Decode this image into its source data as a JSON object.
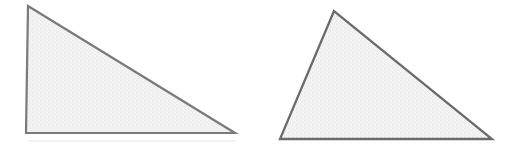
{
  "figure": {
    "title": "",
    "caption": "",
    "background_color": "#ffffff",
    "width": 522,
    "height": 152,
    "stroke_color": "#7a7a7a",
    "stroke_color_dark": "#6b6b6b",
    "fill_color": "#f1f1f1",
    "stroke_width": 2.2,
    "artifact_color": "#e8e8e8",
    "shapes": [
      {
        "name": "right-triangle",
        "kind": "triangle",
        "label": "",
        "vertices": [
          [
            28,
            6
          ],
          [
            26,
            133
          ],
          [
            235,
            133
          ]
        ],
        "points_attr": "28,6 26,133 235,133",
        "fill": "#f1f1f1",
        "stroke": "#7a7a7a"
      },
      {
        "name": "scalene-triangle",
        "kind": "triangle",
        "label": "",
        "vertices": [
          [
            334,
            11
          ],
          [
            280,
            139
          ],
          [
            492,
            139
          ]
        ],
        "points_attr": "334,11 280,139 492,139",
        "fill": "#f1f1f1",
        "stroke": "#6b6b6b"
      }
    ],
    "artifacts": [
      {
        "name": "scan-line-left",
        "x1": 28,
        "y1": 141,
        "x2": 236,
        "y2": 141,
        "color": "#ededed"
      }
    ]
  }
}
